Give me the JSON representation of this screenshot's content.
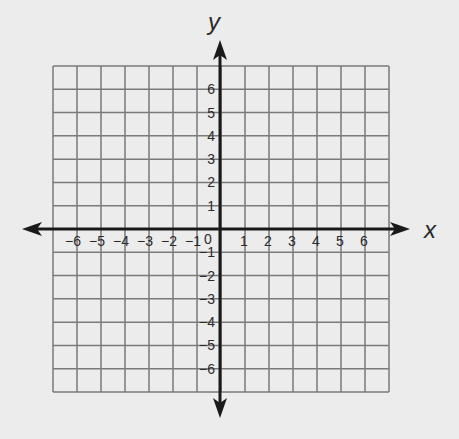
{
  "diagram": {
    "type": "coordinate-plane",
    "x_axis_label": "x",
    "y_axis_label": "y",
    "origin_label": "0",
    "x_range": [
      -7,
      7
    ],
    "y_range": [
      -7,
      7
    ],
    "x_tick_labels": [
      "−6",
      "−5",
      "−4",
      "−3",
      "−2",
      "−1",
      "1",
      "2",
      "3",
      "4",
      "5",
      "6"
    ],
    "x_tick_values": [
      -6,
      -5,
      -4,
      -3,
      -2,
      -1,
      1,
      2,
      3,
      4,
      5,
      6
    ],
    "y_tick_labels": [
      "6",
      "5",
      "4",
      "3",
      "2",
      "1",
      "−1",
      "−2",
      "−3",
      "−4",
      "−5",
      "−6"
    ],
    "y_tick_values": [
      6,
      5,
      4,
      3,
      2,
      1,
      -1,
      -2,
      -3,
      -4,
      -5,
      -6
    ],
    "grid_cells": {
      "columns": 14,
      "rows": 14
    },
    "colors": {
      "background": "#ececec",
      "grid": "#7a7a7a",
      "axis": "#1a1a1a",
      "text": "#2a2a2a"
    }
  }
}
